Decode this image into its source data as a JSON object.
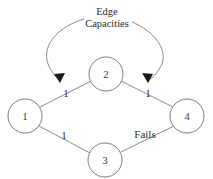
{
  "figure": {
    "background_color": "#ffffff",
    "stroke_color": "#8a8a8a",
    "text_color": "#2b2b2b",
    "arrow_color": "#1a1a1a"
  },
  "annotation": {
    "line1": "Edge",
    "line2": "Capacities"
  },
  "nodes": [
    {
      "id": "1",
      "label": "1",
      "cx": 25,
      "cy": 116,
      "r": 17
    },
    {
      "id": "2",
      "label": "2",
      "cx": 106,
      "cy": 74,
      "r": 17
    },
    {
      "id": "3",
      "label": "3",
      "cx": 105,
      "cy": 160,
      "r": 17
    },
    {
      "id": "4",
      "label": "4",
      "cx": 187,
      "cy": 116,
      "r": 17
    }
  ],
  "edges": [
    {
      "from": "1",
      "to": "2",
      "label": "1",
      "label_x": 66,
      "label_y": 94
    },
    {
      "from": "2",
      "to": "4",
      "label": "1",
      "label_x": 148,
      "label_y": 94
    },
    {
      "from": "1",
      "to": "3",
      "label": "1",
      "label_x": 64,
      "label_y": 136
    },
    {
      "from": "3",
      "to": "4",
      "label": "Fails",
      "label_x": 145,
      "label_y": 135
    }
  ],
  "callouts": [
    {
      "target_edge": "1-2",
      "arrow_x": 60,
      "arrow_y": 82
    },
    {
      "target_edge": "2-4",
      "arrow_x": 148,
      "arrow_y": 82
    }
  ]
}
